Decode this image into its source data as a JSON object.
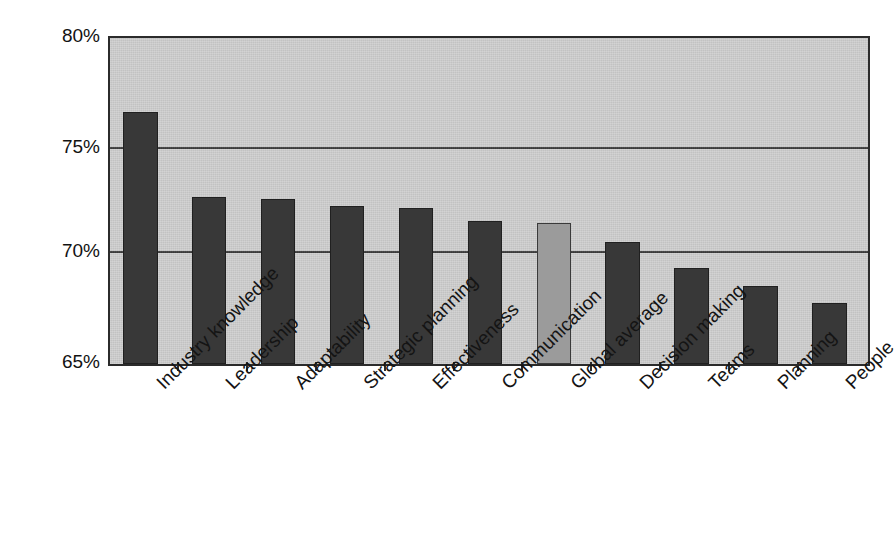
{
  "chart_data": {
    "type": "bar",
    "title": "",
    "subtitle": "",
    "xlabel": "",
    "ylabel": "",
    "ylim": [
      65,
      80
    ],
    "ytick_values": [
      80,
      75,
      70,
      65
    ],
    "ytick_labels": [
      "80%",
      "75%",
      "70%",
      "65%"
    ],
    "grid": true,
    "legend": "none",
    "value_format": "percent",
    "categories": [
      "Industry knowledge",
      "Leadership",
      "Adaptability",
      "Strategic planning",
      "Effectiveness",
      "Communication",
      "Global average",
      "Decision making",
      "Teams",
      "Planning",
      "People"
    ],
    "values": [
      76.6,
      72.7,
      72.6,
      72.25,
      72.2,
      71.6,
      71.5,
      70.6,
      69.4,
      68.6,
      67.8
    ],
    "highlight_index": 6,
    "colors": {
      "bar": "#383838",
      "bar_highlight": "#9b9b9b",
      "plot_background": "#cfcfcf",
      "axis": "#2b2b2b",
      "gridline": "#3c3c3c",
      "page_background": "#ffffff",
      "text": "#141414"
    }
  }
}
